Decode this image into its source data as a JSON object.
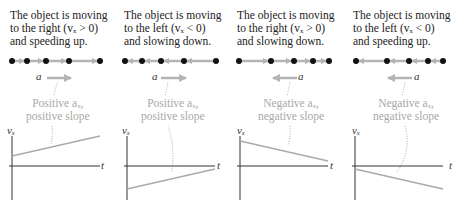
{
  "colors": {
    "text": "#222222",
    "annotation": "#a8a8a8",
    "arrow": "#b4b4b4",
    "dot": "#111111",
    "axis": "#333333",
    "graph_line": "#aaaaaa"
  },
  "panels": [
    {
      "caption_line1": "The object is moving",
      "caption_line2": "to the right (vₓ > 0)",
      "caption_line3": "and speeding up.",
      "dots_x": [
        12,
        27,
        46,
        69,
        100
      ],
      "motion_direction": "right",
      "accel_direction": "right",
      "accel_label": "a⃗",
      "note_line1": "Positive aₓ,",
      "note_line2": "positive slope",
      "y_axis_label": "vₓ",
      "x_axis_label": "t",
      "graph": {
        "start_v": 0.55,
        "end_v": 1.0,
        "slope": "positive"
      }
    },
    {
      "caption_line1": "The object is moving",
      "caption_line2": "to the left (vₓ < 0)",
      "caption_line3": "and slowing down.",
      "dots_x": [
        125,
        142,
        161,
        184,
        216
      ],
      "motion_direction": "left",
      "accel_direction": "right",
      "accel_label": "a⃗",
      "note_line1": "Positive aₓ,",
      "note_line2": "positive slope",
      "y_axis_label": "vₓ",
      "x_axis_label": "t",
      "graph": {
        "start_v": -1.0,
        "end_v": -0.15,
        "slope": "positive"
      }
    },
    {
      "caption_line1": "The object is moving",
      "caption_line2": "to the right (vₓ > 0)",
      "caption_line3": "and slowing down.",
      "dots_x": [
        239,
        271,
        294,
        313,
        329
      ],
      "motion_direction": "right",
      "accel_direction": "left",
      "accel_label": "a⃗",
      "note_line1": "Negative aₓ,",
      "note_line2": "negative slope",
      "y_axis_label": "vₓ",
      "x_axis_label": "t",
      "graph": {
        "start_v": 1.0,
        "end_v": 0.15,
        "slope": "negative"
      }
    },
    {
      "caption_line1": "The object is moving",
      "caption_line2": "to the left (vₓ < 0)",
      "caption_line3": "and speeding up.",
      "dots_x": [
        356,
        387,
        409,
        428,
        443
      ],
      "motion_direction": "left",
      "accel_direction": "left",
      "accel_label": "a⃗",
      "note_line1": "Negative aₓ,",
      "note_line2": "negative slope",
      "y_axis_label": "vₓ",
      "x_axis_label": "t",
      "graph": {
        "start_v": -0.15,
        "end_v": -1.0,
        "slope": "negative"
      }
    }
  ]
}
